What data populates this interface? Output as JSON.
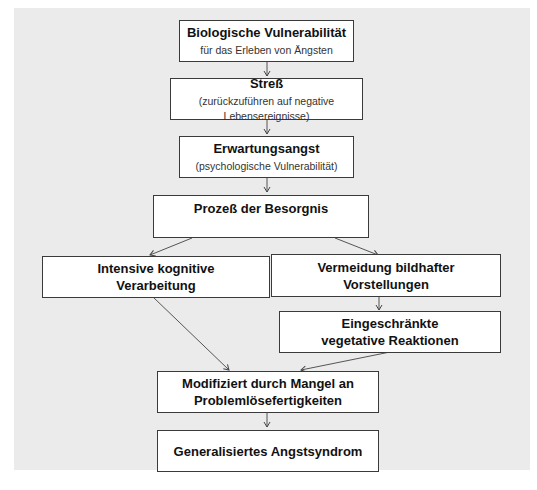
{
  "diagram": {
    "type": "flowchart",
    "nodes": [
      {
        "id": "bio",
        "title": "Biologische Vulnerabilität",
        "subtitle": "für das Erleben von Ängsten"
      },
      {
        "id": "stress",
        "title": "Streß",
        "subtitle": "(zurückzuführen auf negative Lebensereignisse)"
      },
      {
        "id": "erwartung",
        "title": "Erwartungsangst",
        "subtitle": "(psychologische Vulnerabilität)"
      },
      {
        "id": "besorgnis",
        "title": "Prozeß der Besorgnis",
        "subtitle": ""
      },
      {
        "id": "kognitiv",
        "title_line1": "Intensive kognitive",
        "title_line2": "Verarbeitung"
      },
      {
        "id": "vermeidung",
        "title_line1": "Vermeidung bildhafter",
        "title_line2": "Vorstellungen"
      },
      {
        "id": "vegetativ",
        "title_line1": "Eingeschränkte",
        "title_line2": "vegetative Reaktionen"
      },
      {
        "id": "mangel",
        "title_line1": "Modifiziert durch Mangel an",
        "title_line2": "Problemlösefertigkeiten"
      },
      {
        "id": "gas",
        "title": "Generalisiertes Angstsyndrom"
      }
    ],
    "edges": [
      [
        "bio",
        "stress"
      ],
      [
        "stress",
        "erwartung"
      ],
      [
        "erwartung",
        "besorgnis"
      ],
      [
        "besorgnis",
        "kognitiv"
      ],
      [
        "besorgnis",
        "vermeidung"
      ],
      [
        "vermeidung",
        "vegetativ"
      ],
      [
        "kognitiv",
        "mangel"
      ],
      [
        "vegetativ",
        "mangel"
      ],
      [
        "mangel",
        "gas"
      ]
    ]
  }
}
